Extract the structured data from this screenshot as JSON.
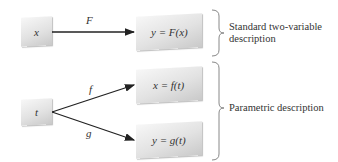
{
  "diagram": {
    "standard": {
      "input_box": "x",
      "arrow_label": "F",
      "output_box": "y = F(x)",
      "description": [
        "Standard two-variable",
        "description"
      ]
    },
    "parametric": {
      "input_box": "t",
      "arrow_labels": [
        "f",
        "g"
      ],
      "output_boxes": [
        "x = f(t)",
        "y = g(t)"
      ],
      "description": "Parametric description"
    },
    "colors": {
      "box_light": "#f7f7f7",
      "box_dark": "#c9c9c9",
      "line": "#222222",
      "brace": "#888888"
    }
  }
}
